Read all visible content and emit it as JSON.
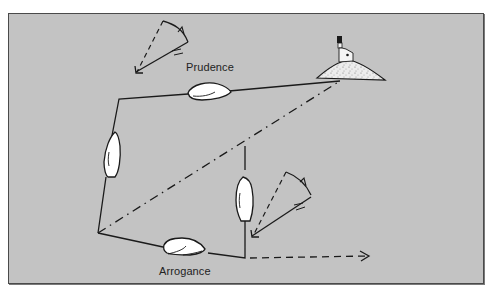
{
  "diagram": {
    "title_visible": false,
    "labels": {
      "upper_boat": "Prudence",
      "lower_boat": "Arrogance"
    },
    "elements": {
      "landmark": "lighthouse-on-island",
      "upper_route": "Prudence course (sails up then along the shore line toward the lighthouse)",
      "lower_route": "Arrogance course (sails along the bottom then tacks up)",
      "rhumb_line": "dash-dot direct line from start to lighthouse",
      "drift_arrow": "dashed arrow pointing right from lower route end",
      "wind_shift_top": "wind arrow with rotation arc near top",
      "wind_shift_lower": "wind arrow with rotation arc near lower right boat"
    },
    "colors": {
      "background": "#c3c3c3",
      "frame_border": "#4a4a4a",
      "stroke": "#1a1a1a",
      "boat_fill": "#ffffff",
      "island_fill": "#e8e8e8"
    }
  }
}
